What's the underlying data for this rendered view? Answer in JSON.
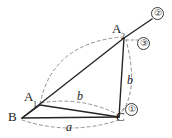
{
  "figure": {
    "background_color": "#ffffff",
    "solid_stroke_color": "#262626",
    "dashed_stroke_color": "#8c8c8c",
    "label_color": "#1a1a1a",
    "vertices": [
      {
        "id": "B",
        "label": "B",
        "subscript": "",
        "x": 22,
        "y": 118
      },
      {
        "id": "A1",
        "label": "A",
        "subscript": "1",
        "x": 40,
        "y": 105
      },
      {
        "id": "C",
        "label": "C",
        "subscript": "",
        "x": 119,
        "y": 117
      },
      {
        "id": "A2",
        "label": "A",
        "subscript": "2",
        "x": 124,
        "y": 38
      }
    ],
    "solid_edges": [
      {
        "from": "B",
        "to": "A1"
      },
      {
        "from": "B",
        "to": "C"
      },
      {
        "from": "B",
        "to": "A2"
      },
      {
        "from": "A1",
        "to": "C"
      },
      {
        "from": "A2",
        "to": "C"
      }
    ],
    "ray": {
      "from": "A2",
      "to_x": 152,
      "to_y": 19
    },
    "dashed_arcs": [
      {
        "name": "arc-a-below-BC",
        "label": "a"
      },
      {
        "name": "arc-b-A1-to-C",
        "label": "b"
      },
      {
        "name": "arc-A1-to-A2",
        "label": ""
      },
      {
        "name": "arc-C-to-A2",
        "label": ""
      }
    ],
    "segment_labels": [
      {
        "name": "label-a",
        "text": "a",
        "x": 68,
        "y": 122
      },
      {
        "name": "label-b1",
        "text": "b",
        "x": 79,
        "y": 92
      },
      {
        "name": "label-b2",
        "text": "b",
        "x": 128,
        "y": 76
      }
    ],
    "step_markers": [
      {
        "name": "step-1",
        "text": "①",
        "x": 126,
        "y": 104
      },
      {
        "name": "step-2",
        "text": "②",
        "x": 152,
        "y": 8
      },
      {
        "name": "step-3",
        "text": "③",
        "x": 137,
        "y": 38
      }
    ]
  }
}
